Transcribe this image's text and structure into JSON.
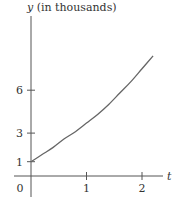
{
  "chart_data": {
    "type": "line",
    "title": "",
    "xlabel": "t",
    "ylabel": "y (in thousands)",
    "ylabel_var": "y",
    "ylabel_rest": " (in thousands)",
    "xlim": [
      -0.3,
      2.4
    ],
    "ylim": [
      -1.5,
      11.2
    ],
    "x_ticks": [
      1,
      2
    ],
    "x_tick_labels": [
      "1",
      "2"
    ],
    "y_ticks": [
      1,
      3,
      6
    ],
    "y_tick_labels": [
      "1",
      "3",
      "6"
    ],
    "origin_label": "0",
    "grid": false,
    "legend": "none",
    "series": [
      {
        "name": "y",
        "x": [
          0,
          0.2,
          0.4,
          0.6,
          0.8,
          1.0,
          1.2,
          1.4,
          1.6,
          1.8,
          2.0,
          2.2
        ],
        "values": [
          1.0,
          1.5,
          2.0,
          2.6,
          3.1,
          3.7,
          4.3,
          5.0,
          5.8,
          6.6,
          7.5,
          8.4
        ]
      }
    ]
  }
}
